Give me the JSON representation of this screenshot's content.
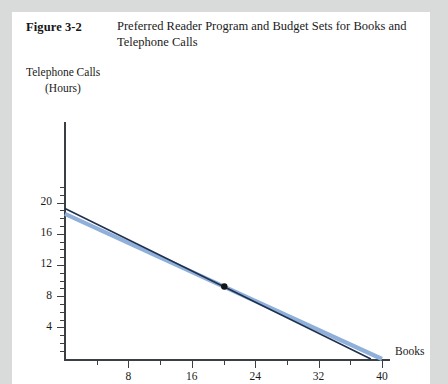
{
  "figure": {
    "number": "Figure 3-2",
    "title": "Preferred Reader Program and Budget Sets for Books and Telephone Calls"
  },
  "axes": {
    "ylabel_line1": "Telephone Calls",
    "ylabel_line2": "(Hours)",
    "xlabel": "Books",
    "ytick_labels": [
      "4",
      "8",
      "12",
      "16",
      "20"
    ],
    "xtick_labels": [
      "8",
      "16",
      "24",
      "32",
      "40"
    ]
  },
  "colors": {
    "budget_line_dark": "#20304f",
    "budget_line_light": "#8fb0da",
    "axis": "#3b3f44",
    "point": "#141414",
    "paper": "#ffffff",
    "backdrop": "#d9dbdb"
  },
  "chart_data": {
    "type": "line",
    "title": "Preferred Reader Program and Budget Sets for Books and Telephone Calls",
    "xlabel": "Books",
    "ylabel": "Telephone Calls (Hours)",
    "xlim": [
      0,
      42.6
    ],
    "ylim": [
      0,
      23.3
    ],
    "xticks": [
      8,
      16,
      24,
      32,
      40
    ],
    "yticks": [
      4,
      8,
      12,
      16,
      20
    ],
    "x_minor_tick_step": 4,
    "y_minor_tick_step": 1,
    "grid": false,
    "legend": null,
    "series": [
      {
        "name": "Original budget line",
        "color": "#20304f",
        "width": 1.6,
        "points": [
          [
            0,
            19.3
          ],
          [
            38.6,
            0
          ]
        ]
      },
      {
        "name": "Preferred reader program budget line",
        "color": "#8fb0da",
        "width": 4.2,
        "points": [
          [
            0,
            18.6
          ],
          [
            40.0,
            0
          ]
        ]
      }
    ],
    "annotations": [
      {
        "type": "point",
        "name": "tangency-point",
        "x": 20.1,
        "y": 9.3,
        "color": "#141414",
        "radius": 3.2
      }
    ]
  }
}
